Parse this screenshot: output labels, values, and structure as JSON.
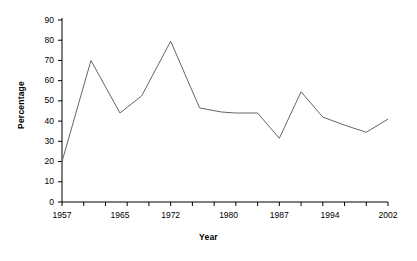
{
  "chart_data": {
    "type": "line",
    "title": "",
    "xlabel": "Year",
    "ylabel": "Percentage",
    "grid": false,
    "legend": "none",
    "xlim": [
      1957,
      2002
    ],
    "ylim": [
      0,
      90
    ],
    "ytick_labels": [
      "90",
      "80",
      "70",
      "60",
      "50",
      "40",
      "30",
      "20",
      "10",
      "0"
    ],
    "ytick_values": [
      90,
      80,
      70,
      60,
      50,
      40,
      30,
      20,
      10,
      0
    ],
    "xtick_labels": [
      "1957",
      "1965",
      "1972",
      "1980",
      "1987",
      "1994",
      "2002"
    ],
    "xtick_values": [
      1957,
      1965,
      1972,
      1980,
      1987,
      1994,
      2002
    ],
    "x": [
      1957,
      1961,
      1965,
      1968,
      1972,
      1976,
      1979,
      1981,
      1984,
      1987,
      1990,
      1993,
      1996,
      1999,
      2002
    ],
    "values": [
      20,
      70,
      44,
      52.5,
      79.5,
      46.5,
      44.5,
      44,
      44,
      31.5,
      54.5,
      42,
      38,
      34.5,
      41
    ],
    "series": [
      {
        "name": "Percentage",
        "color": "#666666",
        "values": [
          20,
          70,
          44,
          52.5,
          79.5,
          46.5,
          44.5,
          44,
          44,
          31.5,
          54.5,
          42,
          38,
          34.5,
          41
        ]
      }
    ],
    "axis_color": "#000000",
    "line_color": "#666666"
  }
}
